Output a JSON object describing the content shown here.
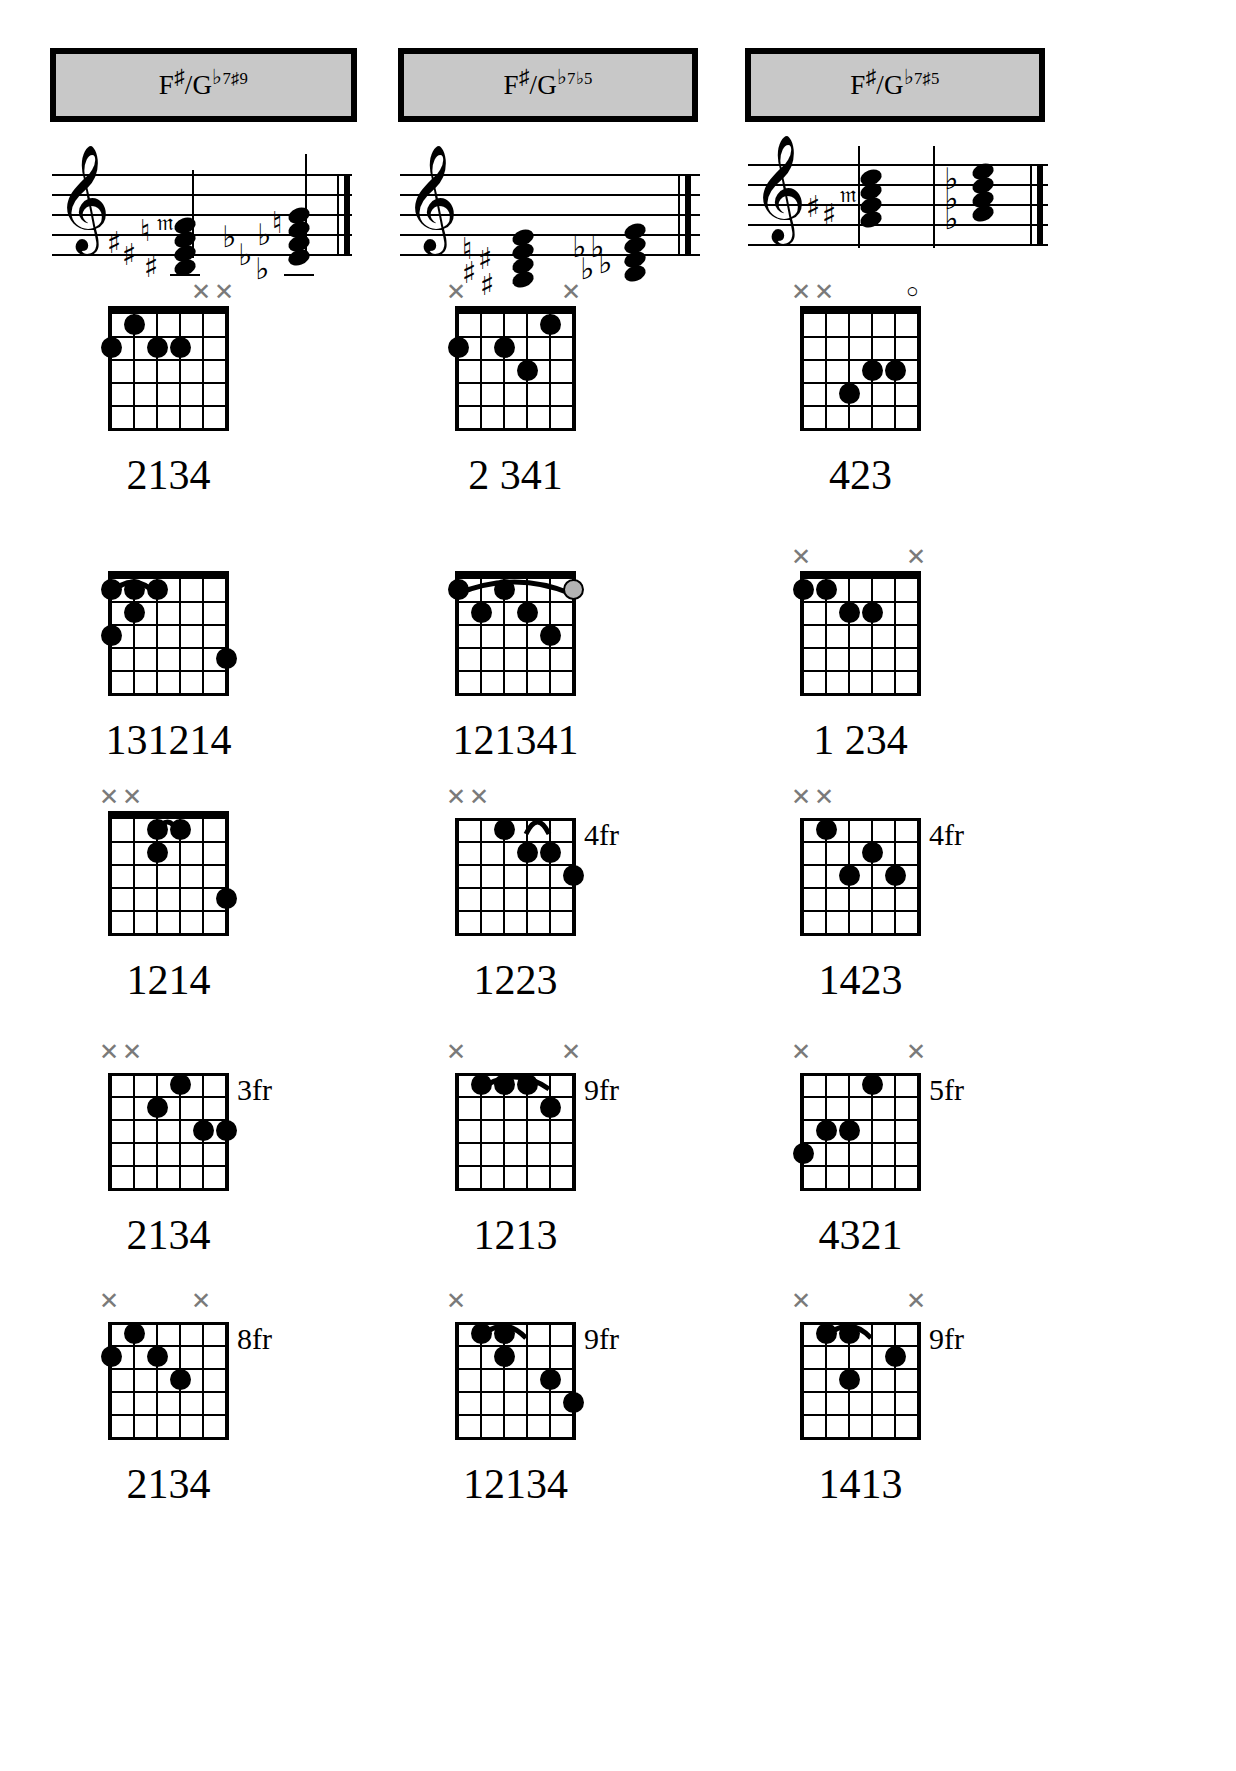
{
  "page": {
    "background": "#ffffff",
    "header_fill": "#c8c8c8",
    "ink": "#000000",
    "muted_mark_color": "#7a7a7a"
  },
  "columns": [
    {
      "id": "col-1",
      "header": {
        "root": "F",
        "root_acc": "♯",
        "slash": "/",
        "alt_root": "G",
        "alt_acc": "♭",
        "quality": "7",
        "ext": "♯9",
        "full_text": "F♯/G♭7♯9"
      },
      "notation": {
        "clef": "treble",
        "chord1_accidentals": [
          "♯",
          "♯",
          "♮",
          "♯",
          "𝄪"
        ],
        "chord2_accidentals": [
          "♭",
          "♭",
          "♭",
          "♭",
          "♮"
        ]
      },
      "voicings": [
        {
          "index": 1,
          "fingers": "2134",
          "fret_label": "",
          "markers": [
            "",
            "",
            "",
            "",
            "x",
            "x"
          ],
          "dots": [
            {
              "string": 0,
              "fret": 2
            },
            {
              "string": 1,
              "fret": 1
            },
            {
              "string": 2,
              "fret": 2
            },
            {
              "string": 3,
              "fret": 2
            }
          ],
          "barre": null
        },
        {
          "index": 2,
          "fingers": "131214",
          "fret_label": "",
          "markers": [
            "",
            "",
            "",
            "",
            "",
            ""
          ],
          "dots": [
            {
              "string": 0,
              "fret": 1
            },
            {
              "string": 1,
              "fret": 1
            },
            {
              "string": 2,
              "fret": 1
            },
            {
              "string": 1,
              "fret": 2
            },
            {
              "string": 0,
              "fret": 3
            },
            {
              "string": 5,
              "fret": 4
            }
          ],
          "barre": {
            "from": 0,
            "to": 2,
            "fret": 1
          }
        },
        {
          "index": 3,
          "fingers": "1214",
          "fret_label": "",
          "markers": [
            "x",
            "x",
            "",
            "",
            "",
            ""
          ],
          "dots": [
            {
              "string": 2,
              "fret": 1
            },
            {
              "string": 3,
              "fret": 1
            },
            {
              "string": 2,
              "fret": 2
            },
            {
              "string": 5,
              "fret": 4
            }
          ],
          "barre": {
            "from": 2,
            "to": 3,
            "fret": 1
          }
        },
        {
          "index": 4,
          "fingers": "2134",
          "fret_label": "3fr",
          "markers": [
            "x",
            "x",
            "",
            "",
            "",
            ""
          ],
          "dots": [
            {
              "string": 2,
              "fret": 2
            },
            {
              "string": 3,
              "fret": 1
            },
            {
              "string": 4,
              "fret": 3
            },
            {
              "string": 5,
              "fret": 3
            }
          ],
          "barre": null
        },
        {
          "index": 5,
          "fingers": "2134",
          "fret_label": "8fr",
          "markers": [
            "x",
            "",
            "",
            "",
            "x",
            ""
          ],
          "dots": [
            {
              "string": 1,
              "fret": 1
            },
            {
              "string": 0,
              "fret": 2
            },
            {
              "string": 2,
              "fret": 2
            },
            {
              "string": 3,
              "fret": 3
            }
          ],
          "barre": null
        }
      ]
    },
    {
      "id": "col-2",
      "header": {
        "root": "F",
        "root_acc": "♯",
        "slash": "/",
        "alt_root": "G",
        "alt_acc": "♭",
        "quality": "7",
        "ext": "♭5",
        "full_text": "F♯/G♭7♭5"
      },
      "notation": {
        "clef": "treble",
        "chord1_accidentals": [
          "♮",
          "♯",
          "♯",
          "♯"
        ],
        "chord2_accidentals": [
          "♭",
          "♭",
          "♭",
          "♭"
        ]
      },
      "voicings": [
        {
          "index": 1,
          "fingers": "2 341",
          "fret_label": "",
          "markers": [
            "x",
            "",
            "",
            "",
            "",
            "x"
          ],
          "dots": [
            {
              "string": 0,
              "fret": 2
            },
            {
              "string": 2,
              "fret": 2
            },
            {
              "string": 3,
              "fret": 3
            },
            {
              "string": 4,
              "fret": 1
            }
          ],
          "barre": null
        },
        {
          "index": 2,
          "fingers": "121341",
          "fret_label": "",
          "markers": [
            "",
            "",
            "",
            "",
            "",
            ""
          ],
          "dots": [
            {
              "string": 0,
              "fret": 1
            },
            {
              "string": 1,
              "fret": 2
            },
            {
              "string": 2,
              "fret": 1
            },
            {
              "string": 3,
              "fret": 2
            },
            {
              "string": 4,
              "fret": 3
            },
            {
              "string": 5,
              "fret": 1
            }
          ],
          "barre": {
            "from": 0,
            "to": 5,
            "fret": 1
          },
          "open_ring_string": 5
        },
        {
          "index": 3,
          "fingers": "1223",
          "fret_label": "4fr",
          "markers": [
            "x",
            "x",
            "",
            "",
            "",
            ""
          ],
          "dots": [
            {
              "string": 2,
              "fret": 1
            },
            {
              "string": 3,
              "fret": 2
            },
            {
              "string": 4,
              "fret": 2
            },
            {
              "string": 5,
              "fret": 3
            }
          ],
          "barre": {
            "from": 3,
            "to": 4,
            "fret": 1
          }
        },
        {
          "index": 4,
          "fingers": "1213",
          "fret_label": "9fr",
          "markers": [
            "x",
            "",
            "",
            "",
            "",
            "x"
          ],
          "dots": [
            {
              "string": 1,
              "fret": 1
            },
            {
              "string": 2,
              "fret": 1
            },
            {
              "string": 3,
              "fret": 1
            },
            {
              "string": 4,
              "fret": 2
            }
          ],
          "barre": {
            "from": 1,
            "to": 4,
            "fret": 1
          }
        },
        {
          "index": 5,
          "fingers": "12134",
          "fret_label": "9fr",
          "markers": [
            "x",
            "",
            "",
            "",
            "",
            ""
          ],
          "dots": [
            {
              "string": 1,
              "fret": 1
            },
            {
              "string": 2,
              "fret": 1
            },
            {
              "string": 2,
              "fret": 2
            },
            {
              "string": 4,
              "fret": 3
            },
            {
              "string": 5,
              "fret": 4
            }
          ],
          "barre": {
            "from": 1,
            "to": 3,
            "fret": 1
          }
        }
      ]
    },
    {
      "id": "col-3",
      "header": {
        "root": "F",
        "root_acc": "♯",
        "slash": "/",
        "alt_root": "G",
        "alt_acc": "♭",
        "quality": "7",
        "ext": "♯5",
        "full_text": "F♯/G♭7♯5"
      },
      "notation": {
        "clef": "treble",
        "chord1_accidentals": [
          "♯",
          "♯",
          "𝄪"
        ],
        "chord2_accidentals": [
          "♭",
          "♭",
          "♭"
        ]
      },
      "voicings": [
        {
          "index": 1,
          "fingers": "423",
          "fret_label": "",
          "markers": [
            "x",
            "x",
            "",
            "",
            "",
            "o"
          ],
          "dots": [
            {
              "string": 2,
              "fret": 4
            },
            {
              "string": 3,
              "fret": 3
            },
            {
              "string": 4,
              "fret": 3
            }
          ],
          "barre": null
        },
        {
          "index": 2,
          "fingers": "1  234",
          "fret_label": "",
          "markers": [
            "x",
            "",
            "",
            "",
            "",
            "x"
          ],
          "dots": [
            {
              "string": 0,
              "fret": 1
            },
            {
              "string": 1,
              "fret": 1
            },
            {
              "string": 2,
              "fret": 2
            },
            {
              "string": 3,
              "fret": 2
            }
          ],
          "barre": null
        },
        {
          "index": 3,
          "fingers": "1423",
          "fret_label": "4fr",
          "markers": [
            "x",
            "x",
            "",
            "",
            "",
            ""
          ],
          "dots": [
            {
              "string": 1,
              "fret": 1
            },
            {
              "string": 3,
              "fret": 2
            },
            {
              "string": 4,
              "fret": 3
            },
            {
              "string": 2,
              "fret": 3
            }
          ],
          "barre": null
        },
        {
          "index": 4,
          "fingers": "4321",
          "fret_label": "5fr",
          "markers": [
            "x",
            "",
            "",
            "",
            "",
            "x"
          ],
          "dots": [
            {
              "string": 3,
              "fret": 1
            },
            {
              "string": 2,
              "fret": 3
            },
            {
              "string": 1,
              "fret": 3
            },
            {
              "string": 0,
              "fret": 4
            }
          ],
          "barre": null
        },
        {
          "index": 5,
          "fingers": "1413",
          "fret_label": "9fr",
          "markers": [
            "x",
            "",
            "",
            "",
            "",
            "x"
          ],
          "dots": [
            {
              "string": 1,
              "fret": 1
            },
            {
              "string": 2,
              "fret": 1
            },
            {
              "string": 2,
              "fret": 3
            },
            {
              "string": 4,
              "fret": 2
            }
          ],
          "barre": {
            "from": 1,
            "to": 3,
            "fret": 1
          }
        }
      ]
    }
  ]
}
